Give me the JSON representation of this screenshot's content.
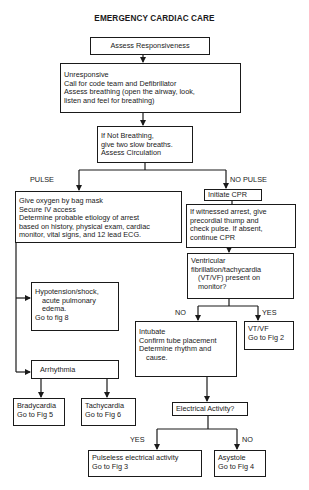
{
  "title": "EMERGENCY CARDIAC CARE",
  "nodes": {
    "assess_responsiveness": {
      "lines": [
        "Assess Responsiveness"
      ]
    },
    "unresponsive": {
      "lines": [
        "Unresponsive",
        "Call for code team and Defibrillator",
        "Assess breathing (open the airway, look,",
        "listen and feel for breathing)"
      ]
    },
    "not_breathing": {
      "lines": [
        "If Not Breathing,",
        "give two slow breaths.",
        "Assess Circulation"
      ]
    },
    "pulse_care": {
      "lines": [
        "Give oxygen by bag mask",
        "Secure IV access",
        "Determine probable etiology of arrest",
        "based on history, physical exam, cardiac",
        "monitor, vital signs, and 12 lead ECG."
      ]
    },
    "initiate_cpr": {
      "lines": [
        "Initiate CPR"
      ]
    },
    "witnessed_arrest": {
      "lines": [
        "If witnessed arrest, give",
        "precordial thump and",
        "check pulse.  If absent,",
        "continue CPR"
      ]
    },
    "vtvf_question": {
      "lines": [
        "Ventricular",
        "fibrillation/tachycardia",
        "(VT/VF) present on",
        "monitor?"
      ]
    },
    "hypotension": {
      "lines": [
        "Hypotension/shock,",
        "acute pulmonary",
        "edema.",
        "Go to fig 8"
      ]
    },
    "intubate": {
      "lines": [
        "Intubate",
        "Confirm tube placement",
        "Determine rhythm and",
        "cause."
      ]
    },
    "vtvf_result": {
      "lines": [
        "VT/VF",
        "Go to Fig 2"
      ]
    },
    "arrhythmia": {
      "lines": [
        "Arrhythmia"
      ]
    },
    "bradycardia": {
      "lines": [
        "Bradycardia",
        "Go to Fig 5"
      ]
    },
    "tachycardia": {
      "lines": [
        "Tachycardia",
        "Go to Fig 6"
      ]
    },
    "electrical_activity": {
      "lines": [
        "Electrical Activity?"
      ]
    },
    "pea": {
      "lines": [
        "Pulseless electrical activity",
        "Go to Fig 3"
      ]
    },
    "asystole": {
      "lines": [
        "Asystole",
        "Go to Fig 4"
      ]
    }
  },
  "edge_labels": {
    "pulse": "PULSE",
    "no_pulse": "NO PULSE",
    "vtvf_no": "NO",
    "vtvf_yes": "YES",
    "ea_yes": "YES",
    "ea_no": "NO"
  },
  "colors": {
    "ink": "#1a1a1a",
    "background": "#ffffff"
  }
}
